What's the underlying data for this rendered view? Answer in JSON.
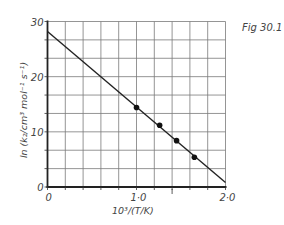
{
  "chart_data": {
    "type": "scatter",
    "title": "",
    "figure_label": "Fig 30.1",
    "xlabel": "10³/(T/K)",
    "ylabel": "ln (k₂/cm³ mol⁻¹ s⁻¹)",
    "xlim": [
      0,
      2.0
    ],
    "ylim": [
      0,
      30
    ],
    "x_grid_step": 0.2,
    "y_grid_step": 3.333,
    "grid": true,
    "x_ticks": [
      {
        "value": 0,
        "label": "0"
      },
      {
        "value": 1.0,
        "label": "1·0"
      },
      {
        "value": 2.0,
        "label": "2·0"
      }
    ],
    "y_ticks": [
      {
        "value": 0,
        "label": "0"
      },
      {
        "value": 10,
        "label": "10"
      },
      {
        "value": 20,
        "label": "20"
      },
      {
        "value": 30,
        "label": "30"
      }
    ],
    "points": [
      {
        "x": 1.0,
        "y": 14.4
      },
      {
        "x": 1.26,
        "y": 11.2
      },
      {
        "x": 1.45,
        "y": 8.4
      },
      {
        "x": 1.65,
        "y": 5.4
      }
    ],
    "fit_line": {
      "x": [
        0,
        2.0
      ],
      "y": [
        28.2,
        0.8
      ]
    },
    "legend": "none"
  }
}
